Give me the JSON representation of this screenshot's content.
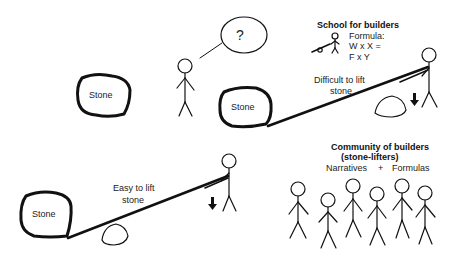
{
  "thought_bubble": {
    "text": "?"
  },
  "scene_top_left": {
    "stone_label": "Stone"
  },
  "scene_top_right": {
    "stone_label": "Stone",
    "caption_line1": "Difficult to lift",
    "caption_line2": "stone"
  },
  "scene_bottom_left": {
    "stone_label": "Stone",
    "caption_line1": "Easy to lift",
    "caption_line2": "stone"
  },
  "school": {
    "title": "School for builders",
    "formula_label": "Formula:",
    "formula_line1": "W x X =",
    "formula_line2": "F x Y"
  },
  "community": {
    "title_line1": "Community of builders",
    "title_line2": "(stone-lifters)",
    "narratives": "Narratives",
    "plus": "+",
    "formulas": "Formulas",
    "member_count": 6
  },
  "colors": {
    "ink": "#111111",
    "background": "#ffffff"
  }
}
